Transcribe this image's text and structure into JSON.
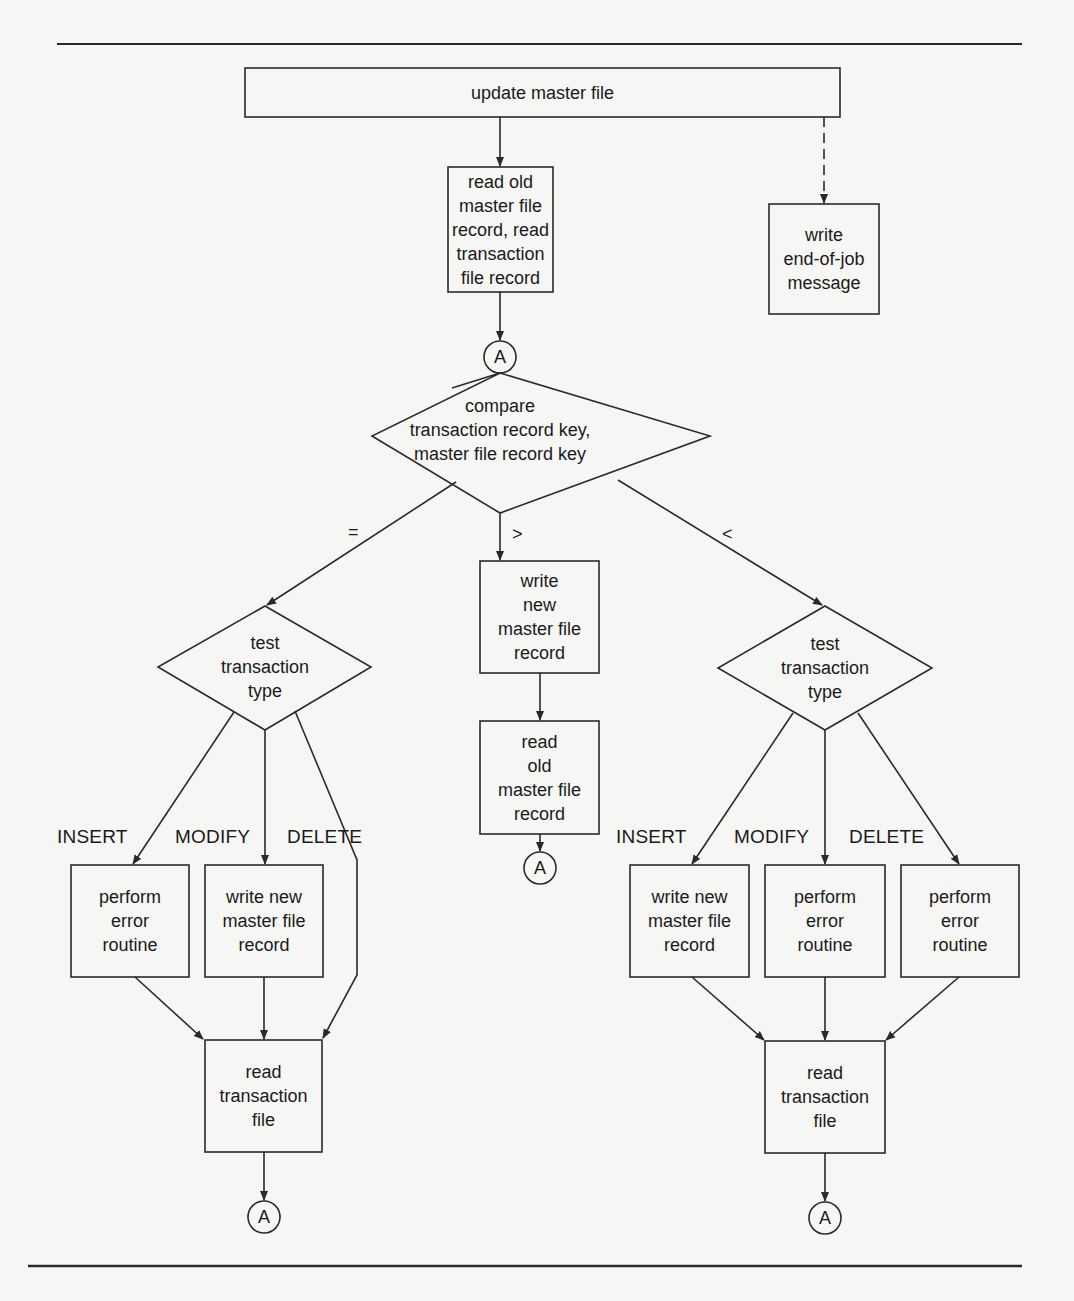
{
  "diagram": {
    "type": "flowchart",
    "colors": {
      "background": "#f6f6f4",
      "line": "#2a2a2a",
      "text": "#1a1a1a"
    },
    "root": {
      "label": "update master file"
    },
    "read_old_initial": {
      "label": "read old\nmaster file\nrecord, read\ntransaction\nfile record"
    },
    "end_of_job": {
      "label": "write\nend-of-job\nmessage"
    },
    "connector_label": "A",
    "compare": {
      "label": "compare\ntransaction record key,\nmaster file record key"
    },
    "branch_labels": {
      "equal": "=",
      "greater": ">",
      "less": "<"
    },
    "greater_branch": {
      "write_new": {
        "label": "write\nnew\nmaster file\nrecord"
      },
      "read_old": {
        "label": "read\nold\nmaster file\nrecord"
      }
    },
    "equal_branch": {
      "test": {
        "label": "test\ntransaction\ntype"
      },
      "cases": {
        "insert": "INSERT",
        "modify": "MODIFY",
        "delete": "DELETE"
      },
      "insert_action": {
        "label": "perform\nerror\nroutine"
      },
      "modify_action": {
        "label": "write new\nmaster file\nrecord"
      },
      "read_transaction": {
        "label": "read\ntransaction\nfile"
      }
    },
    "less_branch": {
      "test": {
        "label": "test\ntransaction\ntype"
      },
      "cases": {
        "insert": "INSERT",
        "modify": "MODIFY",
        "delete": "DELETE"
      },
      "insert_action": {
        "label": "write new\nmaster file\nrecord"
      },
      "modify_action": {
        "label": "perform\nerror\nroutine"
      },
      "delete_action": {
        "label": "perform\nerror\nroutine"
      },
      "read_transaction": {
        "label": "read\ntransaction\nfile"
      }
    }
  }
}
